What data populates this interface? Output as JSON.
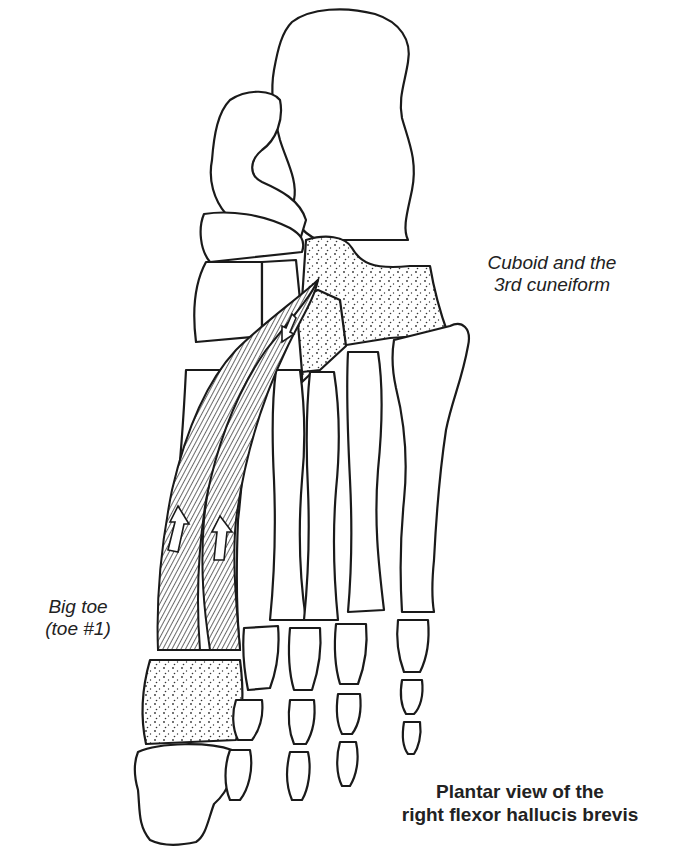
{
  "diagram": {
    "title": "Plantar view of the right flexor hallucis brevis",
    "caption_lines": [
      "Plantar view of the",
      "right flexor hallucis brevis"
    ],
    "labels": {
      "origin": [
        "Cuboid and the",
        "3rd cuneiform"
      ],
      "insertion": [
        "Big toe",
        "(toe #1)"
      ]
    },
    "colors": {
      "line": "#1a1a1a",
      "background": "#ffffff",
      "stipple": "#333333"
    }
  }
}
